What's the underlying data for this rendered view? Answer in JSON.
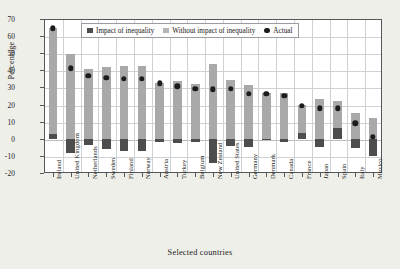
{
  "chart_data": {
    "type": "bar",
    "title": "",
    "xlabel": "Selected countries",
    "ylabel": "Percentage",
    "ylim": [
      -20,
      70
    ],
    "yticks": [
      -20,
      -10,
      0,
      10,
      20,
      30,
      40,
      50,
      60,
      70
    ],
    "ytick_labels": [
      "-20",
      "-10",
      "0",
      "10",
      "20",
      "30",
      "40",
      "50",
      "60",
      "70"
    ],
    "grid": true,
    "legend_position": "top-center-inside",
    "legend": [
      {
        "label": "Impact of inequality",
        "marker": "square",
        "color": "#4d4d4d"
      },
      {
        "label": "Without impact of inequality",
        "marker": "square",
        "color": "#b5b5b5"
      },
      {
        "label": "Actual",
        "marker": "circle",
        "color": "#1c1c1c"
      }
    ],
    "categories": [
      "Ireland",
      "United Kingdom",
      "Netherlands",
      "Sweden",
      "Finland",
      "Norway",
      "Austria",
      "Turkey",
      "Belgium",
      "New Zealand",
      "United States",
      "Germany",
      "Denmark",
      "Canada",
      "France",
      "Japan",
      "Spain",
      "Italy",
      "Mexico"
    ],
    "series": [
      {
        "name": "Without impact of inequality",
        "color": "#a9a9a9",
        "values": [
          64.5,
          49.8,
          40.7,
          42.2,
          42.4,
          42.3,
          32.7,
          34.0,
          31.8,
          43.8,
          34.3,
          31.3,
          26.6,
          26.6,
          20.0,
          23.5,
          22.2,
          15.0,
          12.3
        ]
      },
      {
        "name": "Impact of inequality",
        "color": "#4d4d4d",
        "values": [
          3.0,
          -8.3,
          -3.4,
          -6.0,
          -7.2,
          -7.2,
          -1.8,
          -2.2,
          -1.7,
          -14.2,
          -4.0,
          -4.6,
          -0.3,
          -2.0,
          3.6,
          -4.7,
          6.4,
          -5.6,
          -10.0
        ]
      },
      {
        "name": "Actual",
        "color": "#1c1c1c",
        "marker": "circle",
        "values": [
          64.5,
          41.2,
          36.8,
          35.7,
          35.0,
          34.9,
          32.5,
          30.7,
          29.1,
          29.0,
          29.1,
          26.4,
          26.4,
          25.1,
          19.1,
          17.9,
          17.9,
          9.0,
          1.2
        ]
      }
    ]
  }
}
